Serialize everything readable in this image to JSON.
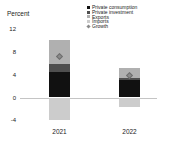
{
  "chart_data": {
    "type": "bar",
    "stacked": true,
    "title": "",
    "ylabel": "Percent",
    "xlabel": "",
    "categories": [
      "2021",
      "2022"
    ],
    "series": [
      {
        "name": "Private consumption",
        "color": "#111111",
        "values": [
          4.4,
          3.0
        ]
      },
      {
        "name": "Private investment",
        "color": "#4f4f4f",
        "values": [
          1.4,
          0.5
        ]
      },
      {
        "name": "Exports",
        "color": "#b0b0b0",
        "values": [
          4.2,
          1.7
        ]
      },
      {
        "name": "Imports",
        "color": "#cccccc",
        "values": [
          -4.0,
          -1.6
        ]
      }
    ],
    "markers": {
      "name": "Growth",
      "shape": "diamond",
      "color": "#8a8a8a",
      "border_color": "#6e6e6e",
      "values": [
        7.1,
        3.9
      ]
    },
    "yticks": [
      12,
      8,
      4,
      0,
      -4
    ],
    "ylim": [
      -4,
      13
    ],
    "grid": false,
    "legend_position": "top-right",
    "zero_line_color": "#c4c4c4"
  }
}
